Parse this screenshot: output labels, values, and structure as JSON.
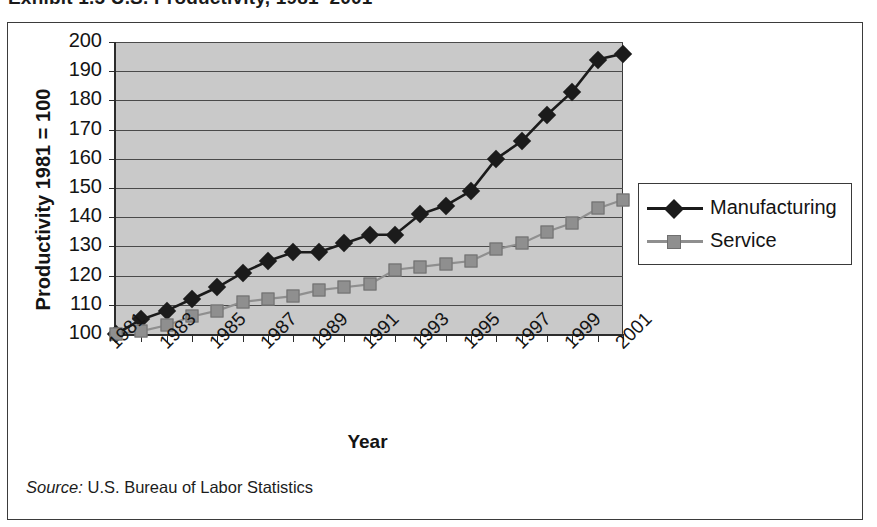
{
  "exhibit": {
    "title": "Exhibit 1.5   U.S. Productivity, 1981–2001"
  },
  "source": {
    "label": "Source:",
    "text": " U.S. Bureau of Labor Statistics"
  },
  "legend": {
    "position": "right",
    "items": [
      {
        "label": "Manufacturing",
        "color": "#1b1b1b",
        "marker": "diamond"
      },
      {
        "label": "Service",
        "color": "#8f8f8f",
        "marker": "square"
      }
    ]
  },
  "chart_data": {
    "type": "line",
    "title": "U.S. Productivity, 1981–2001",
    "xlabel": "Year",
    "ylabel": "Productivity 1981 = 100",
    "x": [
      1981,
      1982,
      1983,
      1984,
      1985,
      1986,
      1987,
      1988,
      1989,
      1990,
      1991,
      1992,
      1993,
      1994,
      1995,
      1996,
      1997,
      1998,
      1999,
      2000,
      2001
    ],
    "tick_labels": [
      "1981",
      "1983",
      "1985",
      "1987",
      "1989",
      "1991",
      "1993",
      "1995",
      "1997",
      "1999",
      "2001"
    ],
    "ylim": [
      100,
      200
    ],
    "ytick_values": [
      100,
      110,
      120,
      130,
      140,
      150,
      160,
      170,
      180,
      190,
      200
    ],
    "grid": true,
    "plot_background": "#c9c9c9",
    "series": [
      {
        "name": "Manufacturing",
        "color": "#1b1b1b",
        "marker": "diamond",
        "values": [
          100,
          105,
          108,
          112,
          116,
          121,
          125,
          128,
          128,
          131,
          134,
          134,
          141,
          144,
          149,
          160,
          166,
          175,
          183,
          194,
          196
        ]
      },
      {
        "name": "Service",
        "color": "#8f8f8f",
        "marker": "square",
        "values": [
          100,
          101,
          103,
          106,
          108,
          111,
          112,
          113,
          115,
          116,
          117,
          122,
          123,
          124,
          125,
          129,
          131,
          135,
          138,
          143,
          146
        ]
      }
    ]
  }
}
